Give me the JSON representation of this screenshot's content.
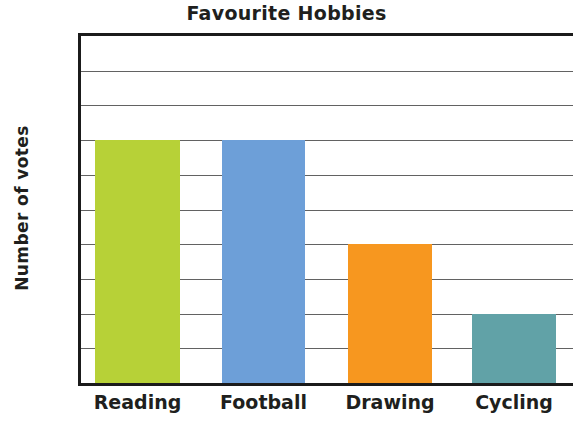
{
  "chart_data": {
    "type": "bar",
    "title": "Favourite Hobbies",
    "xlabel": "",
    "ylabel": "Number of votes",
    "categories": [
      "Reading",
      "Football",
      "Drawing",
      "Cycling"
    ],
    "values": [
      7,
      7,
      4,
      2
    ],
    "bar_colors": [
      "#b7d137",
      "#6d9fd8",
      "#f7971f",
      "#61a2a7"
    ],
    "ylim": [
      0,
      10
    ],
    "y_ticks": [
      1,
      2,
      3,
      4,
      5,
      6,
      7,
      8,
      9,
      10
    ],
    "y_tick_labels": [
      "1",
      "2",
      "3",
      "4",
      "5",
      "6",
      "7",
      "8",
      "9",
      "10"
    ],
    "grid": true,
    "grid_orientation": "horizontal",
    "legend": false,
    "legend_position": "none",
    "series": [
      {
        "name": "Number of votes",
        "values": [
          7,
          7,
          4,
          2
        ]
      }
    ],
    "points": [
      {
        "category": "Reading",
        "value": 7,
        "color": "#b7d137"
      },
      {
        "category": "Football",
        "value": 7,
        "color": "#6d9fd8"
      },
      {
        "category": "Drawing",
        "value": 4,
        "color": "#f7971f"
      },
      {
        "category": "Cycling",
        "value": 2,
        "color": "#61a2a7"
      }
    ]
  },
  "colors": {
    "background": "#ffffff",
    "axis": "#1b1b1b",
    "gridline": "#626262",
    "text": "#201f1d"
  }
}
